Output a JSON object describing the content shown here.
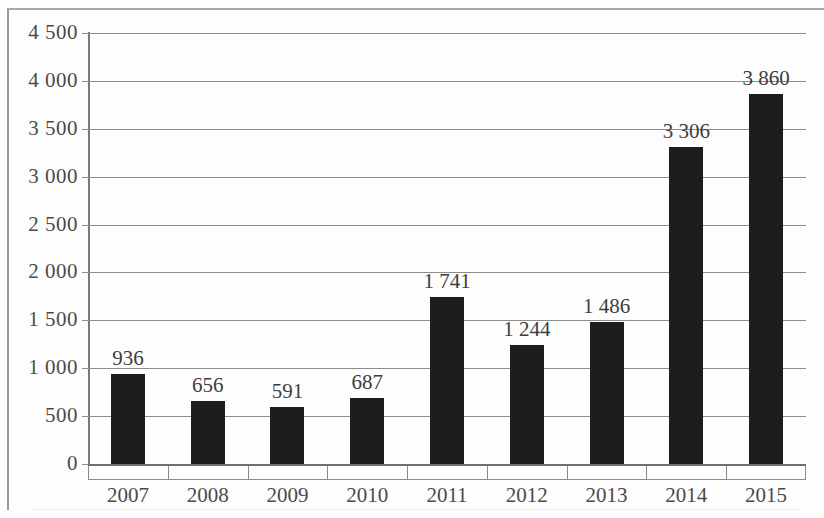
{
  "chart_data": {
    "type": "bar",
    "title": "",
    "subtitle": "",
    "xlabel": "",
    "ylabel": "",
    "categories": [
      "2007",
      "2008",
      "2009",
      "2010",
      "2011",
      "2012",
      "2013",
      "2014",
      "2015"
    ],
    "values": [
      936,
      656,
      591,
      687,
      1741,
      1244,
      1486,
      3306,
      3860
    ],
    "value_labels": [
      "936",
      "656",
      "591",
      "687",
      "1 741",
      "1 244",
      "1 486",
      "3 306",
      "3 860"
    ],
    "ylim": [
      0,
      4500
    ],
    "ytick_values": [
      0,
      500,
      1000,
      1500,
      2000,
      2500,
      3000,
      3500,
      4000,
      4500
    ],
    "ytick_labels": [
      "0",
      "500",
      "1 000",
      "1 500",
      "2 000",
      "2 500",
      "3 000",
      "3 500",
      "4 000",
      "4 500"
    ],
    "grid": true,
    "legend": false,
    "legend_position": "none",
    "bar_color": "#1d1d1d",
    "gridline_color": "#8d8d8d",
    "axis_color": "#6f6f6f",
    "text_color": "#4a4a4a",
    "background_color": "#fdfdfd",
    "thousands_separator": " ",
    "series": [
      {
        "name": "",
        "values": [
          936,
          656,
          591,
          687,
          1741,
          1244,
          1486,
          3306,
          3860
        ]
      }
    ]
  }
}
